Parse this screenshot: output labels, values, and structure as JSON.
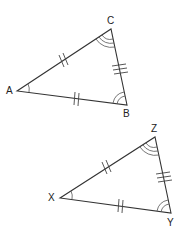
{
  "diagram": {
    "type": "congruent-triangles",
    "triangles": [
      {
        "name": "ABC",
        "vertices": [
          {
            "label": "A",
            "x": 17,
            "y": 91,
            "lx": 10,
            "ly": 94,
            "angle_arcs": 1
          },
          {
            "label": "C",
            "x": 111,
            "y": 29,
            "lx": 111,
            "ly": 23,
            "angle_arcs": 3
          },
          {
            "label": "B",
            "x": 127,
            "y": 105,
            "lx": 127,
            "ly": 117,
            "angle_arcs": 2
          }
        ],
        "sides": [
          {
            "from": "A",
            "to": "C",
            "marks": "slanted-double"
          },
          {
            "from": "C",
            "to": "B",
            "marks": 3
          },
          {
            "from": "A",
            "to": "B",
            "marks": 2
          }
        ]
      },
      {
        "name": "XYZ",
        "vertices": [
          {
            "label": "X",
            "x": 60,
            "y": 198,
            "lx": 53,
            "ly": 201,
            "angle_arcs": 1
          },
          {
            "label": "Z",
            "x": 155,
            "y": 137,
            "lx": 155,
            "ly": 131,
            "angle_arcs": 3
          },
          {
            "label": "Y",
            "x": 171,
            "y": 213,
            "lx": 171,
            "ly": 226,
            "angle_arcs": 2
          }
        ],
        "sides": [
          {
            "from": "X",
            "to": "Z",
            "marks": "slanted-double"
          },
          {
            "from": "Z",
            "to": "Y",
            "marks": 3
          },
          {
            "from": "X",
            "to": "Y",
            "marks": 2
          }
        ]
      }
    ]
  }
}
